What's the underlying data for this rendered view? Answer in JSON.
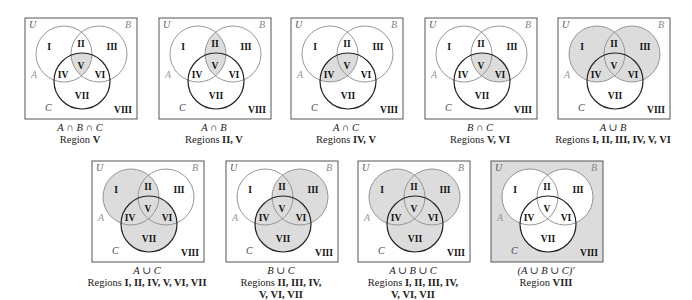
{
  "figure": {
    "shade_color": "#dcdcdc",
    "box_stroke": "#555555",
    "ab_circle_stroke": "#8a8a8a",
    "c_circle_stroke": "#222222",
    "region_labels": [
      "I",
      "II",
      "III",
      "IV",
      "V",
      "VI",
      "VII",
      "VIII"
    ],
    "set_labels": {
      "universe": "U",
      "a": "A",
      "b": "B",
      "c": "C"
    }
  },
  "diagrams": [
    {
      "id": "a-and-b-and-c",
      "x": 24,
      "y": 17,
      "expression": "A ∩ B ∩ C",
      "prefix": "Region",
      "regions_text": "V",
      "shaded": [
        "V"
      ]
    },
    {
      "id": "a-and-b",
      "x": 158,
      "y": 17,
      "expression": "A ∩ B",
      "prefix": "Regions",
      "regions_text": "II, V",
      "shaded": [
        "II",
        "V"
      ]
    },
    {
      "id": "a-and-c",
      "x": 290,
      "y": 17,
      "expression": "A ∩ C",
      "prefix": "Regions",
      "regions_text": "IV, V",
      "shaded": [
        "IV",
        "V"
      ]
    },
    {
      "id": "b-and-c",
      "x": 424,
      "y": 17,
      "expression": "B ∩ C",
      "prefix": "Regions",
      "regions_text": "V, VI",
      "shaded": [
        "V",
        "VI"
      ]
    },
    {
      "id": "a-or-b",
      "x": 557,
      "y": 17,
      "expression": "A ∪ B",
      "prefix": "Regions",
      "regions_text": "I, II, III, IV, V, VI",
      "shaded": [
        "I",
        "II",
        "III",
        "IV",
        "V",
        "VI"
      ]
    },
    {
      "id": "a-or-c",
      "x": 91,
      "y": 160,
      "expression": "A ∪ C",
      "prefix": "Regions",
      "regions_text": "I, II, IV, V, VI, VII",
      "shaded": [
        "I",
        "II",
        "IV",
        "V",
        "VI",
        "VII"
      ]
    },
    {
      "id": "b-or-c",
      "x": 225,
      "y": 160,
      "expression": "B ∪ C",
      "prefix": "Regions",
      "regions_text": "II, III, IV,",
      "regions_text_2": "V, VI, VII",
      "shaded": [
        "II",
        "III",
        "IV",
        "V",
        "VI",
        "VII"
      ]
    },
    {
      "id": "a-or-b-or-c",
      "x": 357,
      "y": 160,
      "expression": "A ∪ B ∪ C",
      "prefix": "Regions",
      "regions_text": "I, II, III, IV,",
      "regions_text_2": "V, VI, VII",
      "shaded": [
        "I",
        "II",
        "III",
        "IV",
        "V",
        "VI",
        "VII"
      ]
    },
    {
      "id": "complement-a-or-b-or-c",
      "x": 490,
      "y": 160,
      "expression": "(A ∪ B ∪ C)′",
      "prefix": "Region",
      "regions_text": "VIII",
      "shaded": [
        "VIII"
      ]
    }
  ]
}
